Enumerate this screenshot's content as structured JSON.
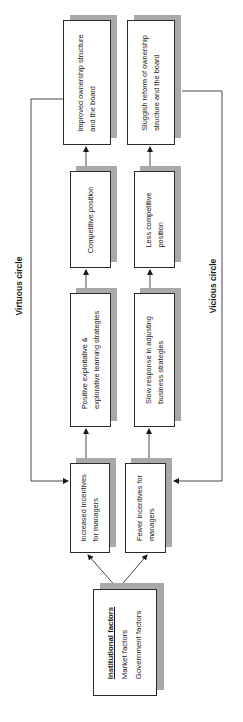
{
  "diagram": {
    "orientation": "rotated -90deg (reads bottom to top)",
    "labels": {
      "virtuous": "Virtuous circle",
      "vicious": "Vicious circle"
    },
    "institutional": {
      "title": "Institutional factors",
      "items": [
        "Market factors",
        "Government factors"
      ]
    },
    "virtuous_chain": [
      {
        "line1": "Increased incentives",
        "line2": "for managers"
      },
      {
        "line1": "Positive exploitative &",
        "line2": "explorative learning strategies"
      },
      {
        "line1": "Competitive position",
        "line2": ""
      },
      {
        "line1": "Improved ownership structure",
        "line2": "and the board"
      }
    ],
    "vicious_chain": [
      {
        "line1": "Fewer incentives for",
        "line2": "managers"
      },
      {
        "line1": "Slow response in adjusting",
        "line2": "business strategies"
      },
      {
        "line1": "Less competitive",
        "line2": "position"
      },
      {
        "line1": "Sluggish reform of ownership",
        "line2": "structure and the board"
      }
    ],
    "colors": {
      "box_border": "#2a2a2a",
      "shadow": "#a9a9a9",
      "line": "#333333"
    }
  }
}
